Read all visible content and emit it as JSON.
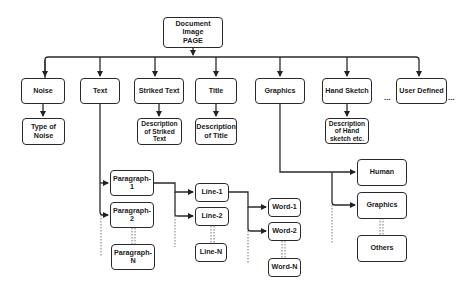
{
  "diagram": {
    "root": {
      "label": "Document Image\nPAGE"
    },
    "categories": [
      {
        "id": "noise",
        "label": "Noise",
        "child": "Type of\nNoise"
      },
      {
        "id": "text",
        "label": "Text"
      },
      {
        "id": "striked",
        "label": "Striked Text",
        "child": "Description\nof Striked\nText"
      },
      {
        "id": "title",
        "label": "Title",
        "child": "Description\nof Title"
      },
      {
        "id": "graphics",
        "label": "Graphics"
      },
      {
        "id": "hand",
        "label": "Hand Sketch",
        "child": "Description\nof Hand\nsketch etc."
      },
      {
        "id": "user",
        "label": "User Defined"
      }
    ],
    "ellipsis": "...",
    "paragraphs": [
      "Paragraph-1",
      "Paragraph-2",
      "Paragraph-N"
    ],
    "lines": [
      "Line-1",
      "Line-2",
      "Line-N"
    ],
    "words": [
      "Word-1",
      "Word-2",
      "Word-N"
    ],
    "graphics_children": [
      "Human",
      "Graphics",
      "Others"
    ]
  }
}
